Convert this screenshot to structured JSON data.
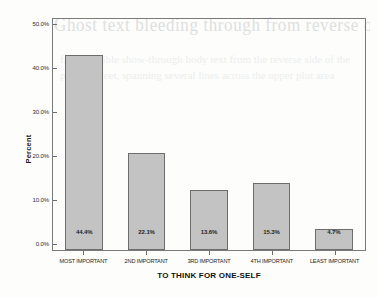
{
  "chart_data": {
    "type": "bar",
    "title": "",
    "xlabel": "TO THINK FOR ONE-SELF",
    "ylabel": "Percent",
    "categories": [
      "MOST IMPORTANT",
      "2ND IMPORTANT",
      "3RD IMPORTANT",
      "4TH IMPORTANT",
      "LEAST IMPORTANT"
    ],
    "values": [
      44.4,
      22.1,
      13.6,
      15.3,
      4.7
    ],
    "value_labels": [
      "44.4%",
      "22.1%",
      "13.6%",
      "15.3%",
      "4.7%"
    ],
    "ylim": [
      0,
      52.5
    ],
    "ytick_values": [
      0,
      10,
      20,
      30,
      40,
      50
    ],
    "ytick_labels": [
      "0.0%",
      "10.0%",
      "20.0%",
      "30.0%",
      "40.0%",
      "50.0%"
    ],
    "grid": false,
    "legend": null,
    "bar_color": "#c3c3c3",
    "bar_border_color": "#6d6d6d",
    "frame_color": "#7a7a7a"
  },
  "artifacts": {
    "bleed_through_line": "Ghost text bleeding through from reverse of scanned page",
    "bleed_through_block": "faint illegible show-through body text from the reverse side of the printed sheet, spanning several lines across the upper plot area"
  }
}
